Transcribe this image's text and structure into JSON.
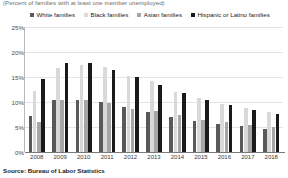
{
  "subtitle": "(Percent of families with at least one member unemployed)",
  "source": "Source: Bureau of Labor Statistics",
  "legend": [
    {
      "label": "White families",
      "color": "#595959"
    },
    {
      "label": "Black families",
      "color": "#d9d9d9"
    },
    {
      "label": "Asian families",
      "color": "#a6a6a6"
    },
    {
      "label": "Hispanic or Latino families",
      "color": "#1a1a1a"
    }
  ],
  "yticks": [
    "25%",
    "20%",
    "15%",
    "10%",
    "5%",
    "0%"
  ],
  "chart_data": {
    "type": "bar",
    "title": "",
    "subtitle": "(Percent of families with at least one member unemployed)",
    "xlabel": "",
    "ylabel": "",
    "ylim": [
      0,
      25
    ],
    "ytick_values": [
      0,
      5,
      10,
      15,
      20,
      25
    ],
    "ytick_labels": [
      "0%",
      "5%",
      "10%",
      "15%",
      "20%",
      "25%"
    ],
    "grid": true,
    "legend_position": "top",
    "categories": [
      "2008",
      "2009",
      "2010",
      "2011",
      "2012",
      "2013",
      "2014",
      "2015",
      "2016",
      "2017",
      "2018"
    ],
    "series": [
      {
        "name": "White families",
        "color": "#595959",
        "values": [
          7.2,
          10.4,
          10.5,
          10.1,
          9.1,
          8.0,
          7.1,
          6.3,
          5.6,
          5.3,
          4.7
        ]
      },
      {
        "name": "Black families",
        "color": "#d9d9d9",
        "values": [
          12.3,
          16.9,
          17.4,
          17.1,
          15.2,
          14.2,
          12.1,
          10.8,
          9.7,
          8.9,
          8.1
        ]
      },
      {
        "name": "Asian families",
        "color": "#a6a6a6",
        "values": [
          6.1,
          10.5,
          10.4,
          9.9,
          8.7,
          8.3,
          7.4,
          6.5,
          6.0,
          5.5,
          5.0
        ]
      },
      {
        "name": "Hispanic or Latino families",
        "color": "#1a1a1a",
        "values": [
          14.6,
          17.8,
          17.8,
          16.5,
          15.1,
          13.4,
          11.8,
          10.4,
          9.4,
          8.5,
          7.7
        ]
      }
    ]
  }
}
